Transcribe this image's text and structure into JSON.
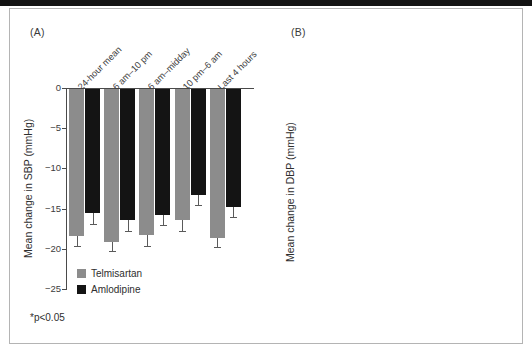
{
  "figure": {
    "panel_a_label": "(A)",
    "panel_b_label": "(B)",
    "footnote": "*p<0.05",
    "legend": {
      "telmisartan": "Telmisartan",
      "amlodipine": "Amlodipine"
    },
    "colors": {
      "telmisartan": "#8c8c8c",
      "amlodipine": "#141414",
      "axis": "#4a4a4a",
      "frame": "#b4b4b4",
      "background": "#ffffff"
    }
  },
  "chart_data": [
    {
      "type": "bar",
      "title": "(A)",
      "xlabel": "",
      "ylabel": "Mean change in SBP (mmHg)",
      "ylim": [
        -25,
        0
      ],
      "yticks": [
        0,
        -5,
        -10,
        -15,
        -20,
        -25
      ],
      "ytick_labels": [
        "0",
        "−5",
        "−10",
        "−15",
        "−20",
        "−25"
      ],
      "grid": false,
      "legend_position": "inside-bottom-left",
      "categories": [
        "24-hour mean",
        "6 am–10 pm",
        "6 am–midday",
        "10 pm–6 am",
        "Last 4 hours"
      ],
      "series": [
        {
          "name": "Telmisartan",
          "color": "#8c8c8c",
          "values": [
            -18.4,
            -19.1,
            -18.3,
            -16.4,
            -18.6
          ],
          "errors": [
            1.3,
            1.2,
            1.3,
            1.4,
            1.2
          ],
          "significant": [
            false,
            false,
            false,
            false,
            false
          ]
        },
        {
          "name": "Amlodipine",
          "color": "#141414",
          "values": [
            -15.6,
            -16.4,
            -15.8,
            -13.3,
            -14.8
          ],
          "errors": [
            1.3,
            1.4,
            1.2,
            1.3,
            1.3
          ],
          "significant": [
            false,
            false,
            false,
            false,
            false
          ]
        }
      ]
    },
    {
      "type": "bar",
      "title": "(B)",
      "xlabel": "",
      "ylabel": "Mean change in DBP (mmHg)",
      "ylim": [
        -14,
        0
      ],
      "yticks": [
        0,
        -2,
        -4,
        -6,
        -8,
        -10,
        -12,
        -14
      ],
      "ytick_labels": [
        "0",
        "−2",
        "−4",
        "−6",
        "−8",
        "−10",
        "−12",
        "−14"
      ],
      "grid": false,
      "legend_position": "none",
      "categories": [
        "24-hour mean",
        "6 am–10 pm",
        "6 am–midday",
        "10 pm–6 am",
        "Last 4 hours"
      ],
      "series": [
        {
          "name": "Telmisartan",
          "color": "#8c8c8c",
          "values": [
            -11.4,
            -11.5,
            -11.8,
            -10.7,
            -12.2
          ],
          "errors": [
            0.8,
            0.9,
            0.9,
            0.9,
            0.9
          ],
          "significant": [
            false,
            false,
            false,
            true,
            true
          ]
        },
        {
          "name": "Amlodipine",
          "color": "#141414",
          "values": [
            -9.5,
            -10.1,
            -10.1,
            -7.7,
            -8.8
          ],
          "errors": [
            0.8,
            0.8,
            0.8,
            0.8,
            0.8
          ],
          "significant": [
            false,
            false,
            false,
            false,
            false
          ]
        }
      ]
    }
  ]
}
